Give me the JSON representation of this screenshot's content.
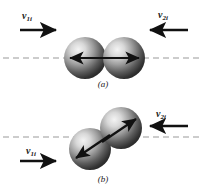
{
  "figure": {
    "background_color": "#ffffff",
    "ink_color": "#1a1a1a",
    "axis_line_color": "#9a9a9a",
    "sphere_dark": "#2b2b2b",
    "sphere_light": "#f0f0f0"
  },
  "panels": [
    {
      "id": "a",
      "caption": "(a)",
      "description": "head-on collision along the line of centers",
      "labels": {
        "left_velocity": {
          "symbol": "v",
          "subscript": "1i",
          "direction": "right"
        },
        "right_velocity": {
          "symbol": "v",
          "subscript": "2i",
          "direction": "left"
        }
      },
      "spheres": [
        {
          "name": "sphere-left",
          "cx": 85,
          "cy": 58,
          "r": 21
        },
        {
          "name": "sphere-right",
          "cx": 124,
          "cy": 58,
          "r": 21
        }
      ],
      "contact_arrows": {
        "left_arrow": {
          "from_x": 108,
          "to_x": 72,
          "y": 58
        },
        "right_arrow": {
          "from_x": 102,
          "to_x": 138,
          "y": 58
        }
      },
      "dashed_axis_y": 58
    },
    {
      "id": "b",
      "caption": "(b)",
      "description": "glancing collision, line of centers tilted",
      "labels": {
        "left_velocity": {
          "symbol": "v",
          "subscript": "1i",
          "direction": "right"
        },
        "right_velocity": {
          "symbol": "v",
          "subscript": "2i",
          "direction": "left"
        }
      },
      "spheres": [
        {
          "name": "sphere-lower-left",
          "cx": 90,
          "cy": 53,
          "r": 21
        },
        {
          "name": "sphere-upper-right",
          "cx": 121,
          "cy": 32,
          "r": 21
        }
      ],
      "contact_arrows": {
        "left_arrow": {
          "from_x": 110,
          "from_y": 39,
          "to_x": 74,
          "to_y": 63
        },
        "right_arrow": {
          "from_x": 101,
          "from_y": 47,
          "to_x": 137,
          "to_y": 23
        }
      },
      "dashed_axis_y": 41
    }
  ],
  "arrows": {
    "panel_a_left": {
      "x1": 20,
      "x2": 58,
      "y": 30
    },
    "panel_a_right": {
      "x1": 188,
      "x2": 146,
      "y": 30
    },
    "panel_b_left": {
      "x1": 20,
      "x2": 58,
      "y": 65
    },
    "panel_b_right": {
      "x1": 188,
      "x2": 146,
      "y": 30
    }
  }
}
